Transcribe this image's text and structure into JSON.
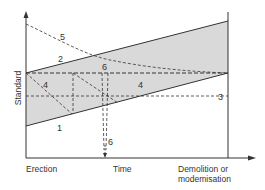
{
  "diagram": {
    "type": "building-standard-over-time",
    "axes": {
      "y_label": "Standard",
      "x_labels": {
        "start": "Erection",
        "middle": "Time",
        "end_line1": "Demolition or",
        "end_line2": "modemisation"
      }
    },
    "curve_labels": {
      "line1": "1",
      "line2": "2",
      "line3": "3",
      "zone4_left": "4",
      "zone4_right": "4",
      "curve5": "5",
      "marker6_top": "6",
      "marker6_bottom": "6"
    },
    "colors": {
      "band_fill": "#d9d9d9",
      "line": "#333333",
      "background": "#ffffff"
    }
  }
}
